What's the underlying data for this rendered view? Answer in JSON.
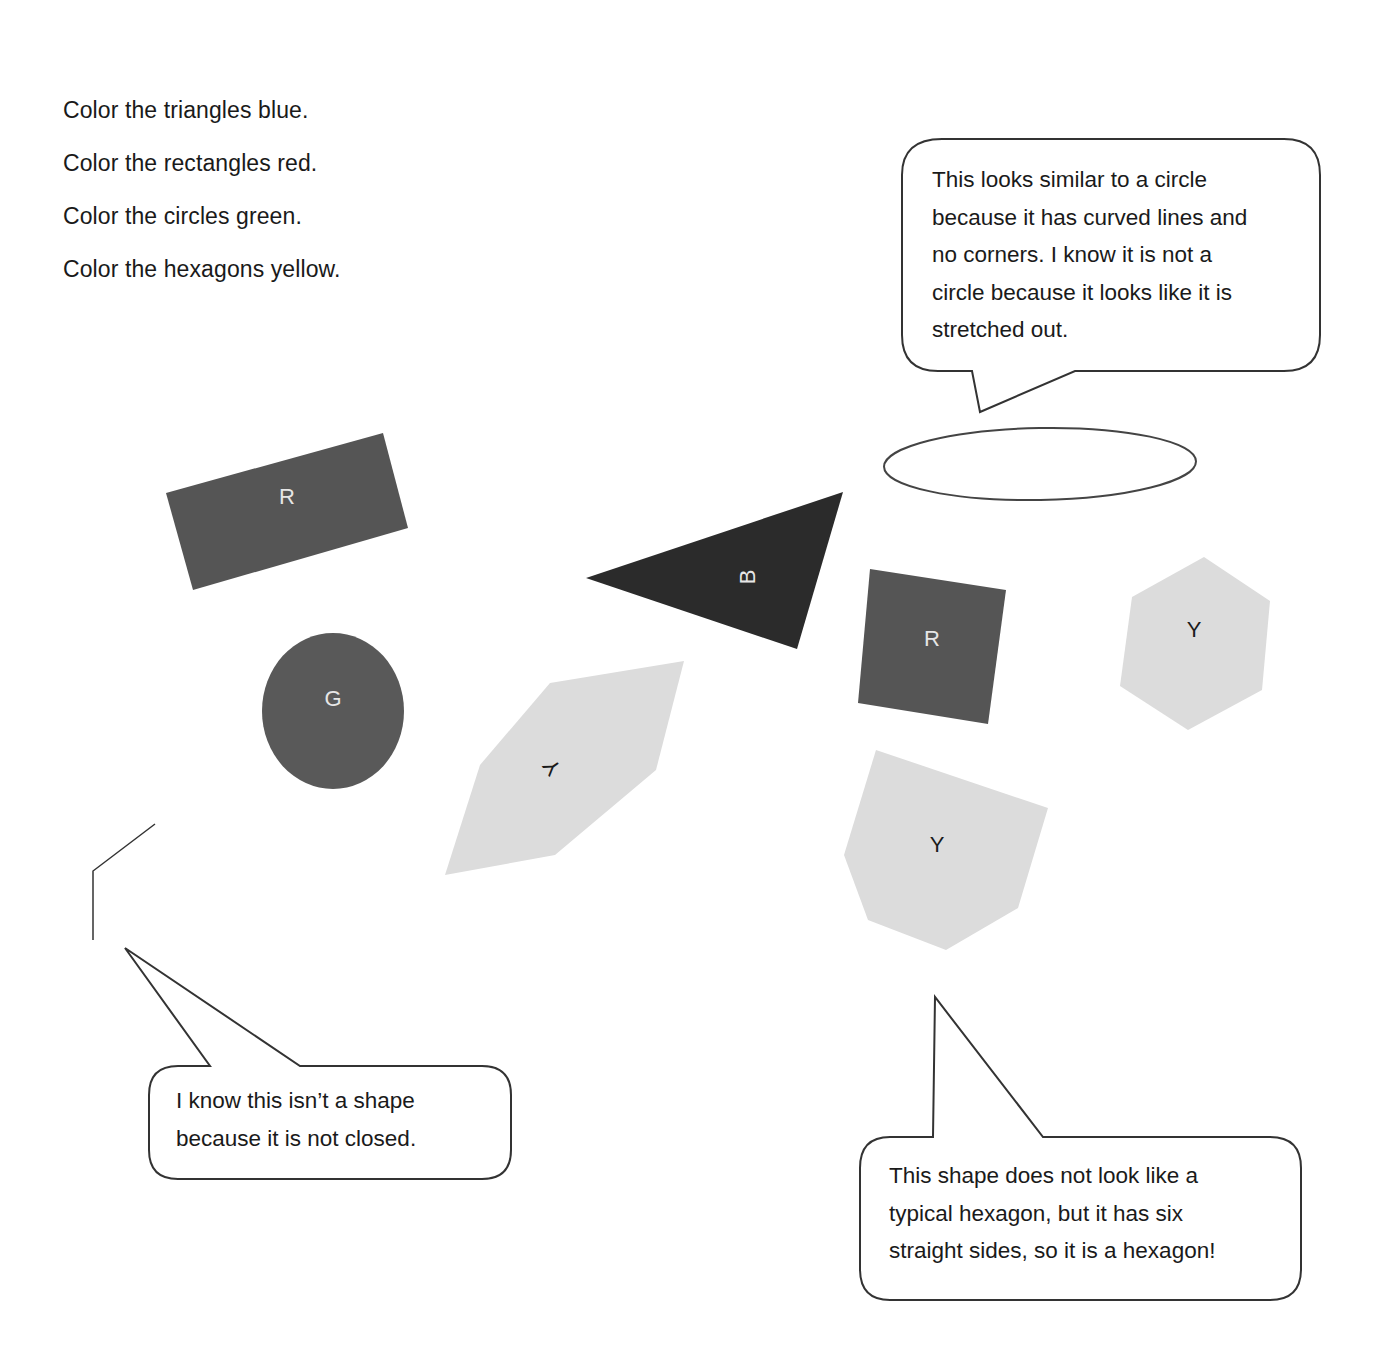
{
  "worksheet": {
    "instructions": [
      "Color the triangles blue.",
      "Color the rectangles red.",
      "Color the circles green.",
      "Color the hexagons yellow."
    ],
    "callouts": {
      "ellipse_note": {
        "lines": [
          "This looks similar to a circle",
          "because it has curved lines and",
          "no corners.  I know it is not a",
          "circle because it looks like it is",
          "stretched out."
        ]
      },
      "open_figure_note": {
        "lines": [
          "I know this isn’t a shape",
          "because it is not closed."
        ]
      },
      "irregular_hexagon_note": {
        "lines": [
          "This shape does not look like a",
          "typical hexagon, but it has six",
          "straight sides, so it is a hexagon!"
        ]
      }
    },
    "shapes": {
      "rectangle_1": {
        "label": "R",
        "type": "rectangle",
        "fill": "#555555"
      },
      "triangle_1": {
        "label": "B",
        "type": "triangle",
        "fill": "#2b2b2b"
      },
      "square_1": {
        "label": "R",
        "type": "rectangle",
        "fill": "#555555"
      },
      "hexagon_1": {
        "label": "Y",
        "type": "hexagon",
        "fill": "#dcdcdc"
      },
      "circle_1": {
        "label": "G",
        "type": "circle",
        "fill": "#595959"
      },
      "hexagon_2": {
        "label": "Y",
        "type": "hexagon",
        "fill": "#dcdcdc"
      },
      "hexagon_3": {
        "label": "Y",
        "type": "hexagon",
        "fill": "#dcdcdc"
      },
      "ellipse_1": {
        "type": "ellipse",
        "fill": "none"
      },
      "open_figure_1": {
        "type": "open-polyline",
        "fill": "none"
      }
    },
    "colors": {
      "outline": "#333333",
      "text": "#1a1a1a",
      "dark_label": "#e6e6e6",
      "light_label": "#1a1a1a"
    }
  }
}
